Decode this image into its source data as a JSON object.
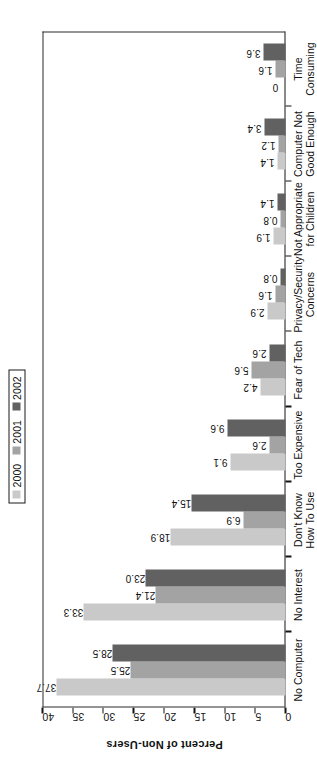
{
  "legend": {
    "entries": [
      {
        "label": "2000",
        "color": "#c9c9c9"
      },
      {
        "label": "2001",
        "color": "#a3a3a3"
      },
      {
        "label": "2002",
        "color": "#616161"
      }
    ]
  },
  "axis": {
    "value_title": "Percent of Non-Users",
    "ticks": [
      "0",
      "5",
      "10",
      "15",
      "20",
      "25",
      "30",
      "35",
      "40"
    ]
  },
  "chart_data": {
    "type": "bar",
    "title": "",
    "xlabel": "",
    "ylabel": "Percent of Non-Users",
    "ylim": [
      0,
      40
    ],
    "orientation": "horizontal-rotated",
    "grid": false,
    "legend_position": "top-left",
    "categories": [
      "No Computer",
      "No Interest",
      "Don't Know How To Use",
      "Too Expensive",
      "Fear of Tech",
      "Privacy/Security Concerns",
      "Not Appropriate for Children",
      "Computer Not Good Enough",
      "Time Consuming"
    ],
    "series": [
      {
        "name": "2000",
        "color": "#c9c9c9",
        "values": [
          37.7,
          33.3,
          18.9,
          9.1,
          4.2,
          2.9,
          1.9,
          1.4,
          0
        ]
      },
      {
        "name": "2001",
        "color": "#a3a3a3",
        "values": [
          25.5,
          21.4,
          6.9,
          2.6,
          5.6,
          1.6,
          0.8,
          1.2,
          1.6
        ]
      },
      {
        "name": "2002",
        "color": "#616161",
        "values": [
          28.5,
          23.0,
          15.4,
          9.6,
          2.6,
          0.8,
          1.4,
          3.4,
          3.6
        ]
      }
    ],
    "data_labels": [
      [
        "37.7",
        "33.3",
        "18.9",
        "9.1",
        "4.2",
        "2.9",
        "1.9",
        "1.4",
        "0"
      ],
      [
        "25.5",
        "21.4",
        "6.9",
        "2.6",
        "5.6",
        "1.6",
        "0.8",
        "1.2",
        "1.6"
      ],
      [
        "28.5",
        "23.0",
        "15.4",
        "9.6",
        "2.6",
        "0.8",
        "1.4",
        "3.4",
        "3.6"
      ]
    ]
  }
}
